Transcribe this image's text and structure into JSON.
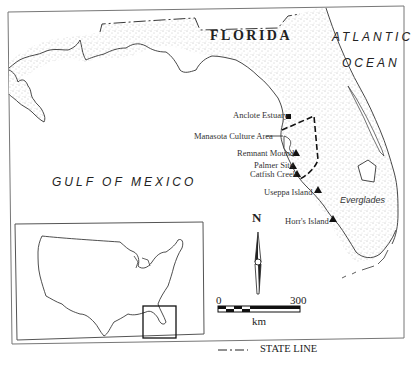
{
  "map": {
    "region_label": "FLORIDA",
    "ocean_labels": {
      "atlantic_line1": "ATLANTIC",
      "atlantic_line2": "OCEAN",
      "gulf": "GULF OF MEXICO"
    },
    "area_label": "Everglades",
    "sites": [
      {
        "name": "Anclote Estuary",
        "marker": "square"
      },
      {
        "name": "Manasota Culture Area",
        "marker": "leader-line"
      },
      {
        "name": "Remnant Mound",
        "marker": "triangle"
      },
      {
        "name": "Palmer Site",
        "marker": "triangle"
      },
      {
        "name": "Catfish Creek",
        "marker": "triangle"
      },
      {
        "name": "Useppa Island",
        "marker": "triangle"
      },
      {
        "name": "Horr's Island",
        "marker": "triangle"
      }
    ],
    "north_arrow": {
      "label": "N",
      "icon": "north-arrow-icon"
    },
    "scale_bar": {
      "start": "0",
      "end": "300",
      "unit": "km"
    },
    "legend": {
      "state_line": "STATE LINE",
      "symbol": "dash-dot-line"
    },
    "inset": {
      "description": "Contiguous United States outline with Florida highlighted by box"
    },
    "colors": {
      "ink": "#222222",
      "stipple": "#8a8a8a",
      "background": "#ffffff",
      "frame": "#777777"
    }
  }
}
